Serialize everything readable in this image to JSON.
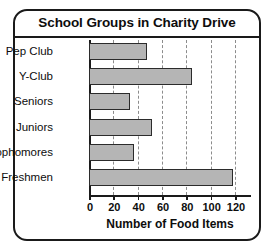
{
  "chart_data": {
    "type": "bar",
    "orientation": "horizontal",
    "title": "School Groups in Charity Drive",
    "xlabel": "Number of Food Items",
    "ylabel": "",
    "categories": [
      "Pep Club",
      "Y-Club",
      "Seniors",
      "Juniors",
      "Sophomores",
      "Freshmen"
    ],
    "values": [
      48,
      85,
      34,
      52,
      37,
      118
    ],
    "xlim": [
      0,
      120
    ],
    "xticks": [
      0,
      20,
      40,
      60,
      80,
      100,
      120
    ],
    "xtick_labels": [
      "0",
      "20",
      "40",
      "60",
      "80",
      "100",
      "120"
    ],
    "gridlines": [
      20,
      40,
      60,
      80,
      100,
      120
    ],
    "grid": true,
    "legend": false,
    "bar_fill": "#b5b5b5",
    "bar_edge": "#2b2b2b",
    "grid_color": "#8c8c8c",
    "axis_color": "#1a1a1a",
    "border_color": "#1a1a1a"
  }
}
